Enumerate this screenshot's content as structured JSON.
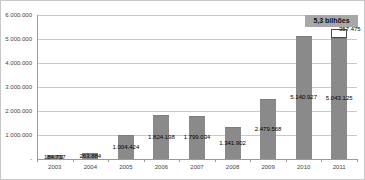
{
  "chart_data": {
    "type": "bar",
    "title": "",
    "categories": [
      "2003",
      "2004",
      "2005",
      "2006",
      "2007",
      "2008",
      "2009",
      "2010",
      "2011"
    ],
    "series": [
      {
        "name": "valor-anual",
        "color": "#8a8a8a",
        "values": [
          184717,
          263884,
          1004424,
          1824198,
          1799034,
          1341902,
          2479568,
          5140927,
          5043125
        ],
        "labels": [
          "184.717",
          "263.884",
          "1.004.424",
          "1.824.198",
          "1.799.034",
          "1.341.902",
          "2.479.568",
          "5.140.927",
          "5.043.125"
        ]
      },
      {
        "name": "segmento-adicional-2011",
        "color": "#ffffff",
        "values": [
          0,
          0,
          0,
          0,
          0,
          0,
          0,
          0,
          357475
        ],
        "labels": [
          "",
          "",
          "",
          "",
          "",
          "",
          "",
          "",
          "357.475"
        ]
      }
    ],
    "extra_label": "357.475",
    "annotation": "5,3 bilhões",
    "y_ticks": [
      "6.000.000",
      "5.000.000",
      "4.000.000",
      "3.000.000",
      "2.000.000",
      "1.000.000",
      "-"
    ],
    "ylim": [
      0,
      6000000
    ],
    "grid": true,
    "legend": "none"
  },
  "colors": {
    "bar": "#8a8a8a",
    "bar_border": "#7d7d7d",
    "white_segment": "#ffffff",
    "white_segment_border": "#4a4a4a",
    "gridline": "#c9c9c9",
    "axis": "#9a9a9a",
    "annotation_bg": "#a8a8a8",
    "label_text": "#000000"
  }
}
